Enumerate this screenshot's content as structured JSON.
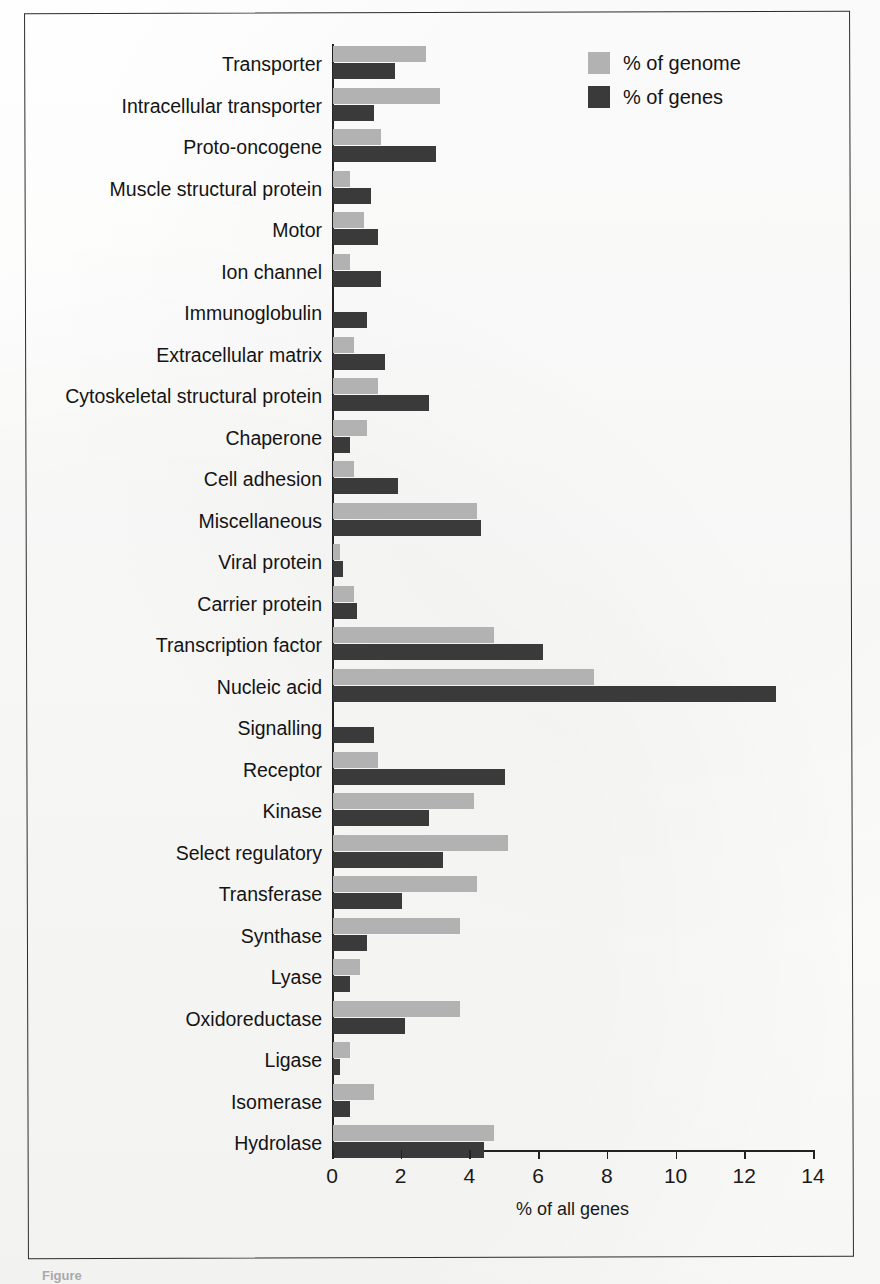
{
  "figure": {
    "frame": true,
    "caption_fragment": "Figure"
  },
  "legend": {
    "position": "top-right",
    "items": [
      {
        "label": "% of genome",
        "color": "#b2b2b2",
        "swatch_name": "legend-swatch-genome"
      },
      {
        "label": "% of genes",
        "color": "#3a3a3a",
        "swatch_name": "legend-swatch-genes"
      }
    ]
  },
  "axis": {
    "x_title": "% of all genes",
    "x_ticks": [
      "0",
      "2",
      "4",
      "6",
      "8",
      "10",
      "12",
      "14"
    ]
  },
  "chart_data": {
    "type": "bar",
    "orientation": "horizontal",
    "title": "",
    "xlabel": "% of all genes",
    "ylabel": "",
    "xlim": [
      0,
      14
    ],
    "grid": false,
    "legend_position": "top-right",
    "categories": [
      "Transporter",
      "Intracellular transporter",
      "Proto-oncogene",
      "Muscle structural protein",
      "Motor",
      "Ion channel",
      "Immunoglobulin",
      "Extracellular matrix",
      "Cytoskeletal structural protein",
      "Chaperone",
      "Cell adhesion",
      "Miscellaneous",
      "Viral protein",
      "Carrier protein",
      "Transcription factor",
      "Nucleic acid",
      "Signalling",
      "Receptor",
      "Kinase",
      "Select regulatory",
      "Transferase",
      "Synthase",
      "Lyase",
      "Oxidoreductase",
      "Ligase",
      "Isomerase",
      "Hydrolase"
    ],
    "series": [
      {
        "name": "% of genome",
        "color": "#b2b2b2",
        "values": [
          2.7,
          3.1,
          1.4,
          0.5,
          0.9,
          0.5,
          0.0,
          0.6,
          1.3,
          1.0,
          0.6,
          4.2,
          0.2,
          0.6,
          4.7,
          7.6,
          0.0,
          1.3,
          4.1,
          5.1,
          4.2,
          3.7,
          0.8,
          3.7,
          0.5,
          1.2,
          4.7
        ]
      },
      {
        "name": "% of genes",
        "color": "#3a3a3a",
        "values": [
          1.8,
          1.2,
          3.0,
          1.1,
          1.3,
          1.4,
          1.0,
          1.5,
          2.8,
          0.5,
          1.9,
          4.3,
          0.3,
          0.7,
          6.1,
          12.9,
          1.2,
          5.0,
          2.8,
          3.2,
          2.0,
          1.0,
          0.5,
          2.1,
          0.2,
          0.5,
          4.4
        ]
      }
    ]
  }
}
